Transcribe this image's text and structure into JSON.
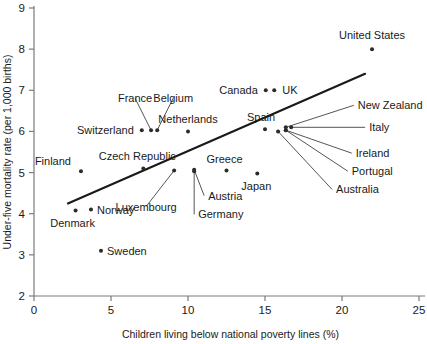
{
  "chart_data": {
    "type": "scatter",
    "title": "",
    "xlabel": "Children living below national poverty lines (%)",
    "ylabel": "Under-five mortality rate (per 1,000 births)",
    "xlim": [
      0,
      25
    ],
    "ylim": [
      2,
      9
    ],
    "xticks": [
      0,
      5,
      10,
      15,
      20,
      25
    ],
    "yticks": [
      2,
      3,
      4,
      5,
      6,
      7,
      8,
      9
    ],
    "xtick_labels": [
      "0",
      "5",
      "10",
      "15",
      "20",
      "25"
    ],
    "ytick_labels": [
      "2",
      "3",
      "4",
      "5",
      "6",
      "7",
      "8",
      "9"
    ],
    "grid": false,
    "legend": false,
    "points": [
      {
        "label": "Sweden",
        "x": 4.35,
        "y": 3.1,
        "label_dx": 6,
        "label_dy": 4,
        "anchor": "start",
        "leader": false
      },
      {
        "label": "Denmark",
        "x": 2.7,
        "y": 4.08,
        "label_dx": -3,
        "label_dy": 17,
        "anchor": "middle",
        "leader": false
      },
      {
        "label": "Norway",
        "x": 3.7,
        "y": 4.1,
        "label_dx": 6,
        "label_dy": 4,
        "anchor": "start",
        "leader": false
      },
      {
        "label": "Finland",
        "x": 3.05,
        "y": 5.03,
        "label_dx": -10,
        "label_dy": -6,
        "anchor": "end",
        "leader": false
      },
      {
        "label": "Czech Republic",
        "x": 7.1,
        "y": 5.1,
        "label_dx": -6,
        "label_dy": -8,
        "anchor": "middle",
        "leader": false
      },
      {
        "label": "Luxembourg",
        "x": 9.1,
        "y": 5.05,
        "label_dx": -28,
        "label_dy": 40,
        "anchor": "middle",
        "leader": true
      },
      {
        "label": "Austria",
        "x": 10.4,
        "y": 5.07,
        "label_dx": 14,
        "label_dy": 30,
        "anchor": "start",
        "leader": true
      },
      {
        "label": "Germany",
        "x": 10.4,
        "y": 5.03,
        "label_dx": 4,
        "label_dy": 47,
        "anchor": "start",
        "leader": true
      },
      {
        "label": "Greece",
        "x": 12.5,
        "y": 5.05,
        "label_dx": -2,
        "label_dy": -8,
        "anchor": "middle",
        "leader": false
      },
      {
        "label": "Japan",
        "x": 14.5,
        "y": 4.98,
        "label_dx": -1,
        "label_dy": 17,
        "anchor": "middle",
        "leader": false
      },
      {
        "label": "Switzerland",
        "x": 7.0,
        "y": 6.03,
        "label_dx": -8,
        "label_dy": 4,
        "anchor": "end",
        "leader": false
      },
      {
        "label": "France",
        "x": 7.6,
        "y": 6.03,
        "label_dx": -16,
        "label_dy": -28,
        "anchor": "middle",
        "leader": true
      },
      {
        "label": "Belgium",
        "x": 8.0,
        "y": 6.03,
        "label_dx": 16,
        "label_dy": -28,
        "anchor": "middle",
        "leader": true
      },
      {
        "label": "Netherlands",
        "x": 10.0,
        "y": 6.0,
        "label_dx": 0,
        "label_dy": -8,
        "anchor": "middle",
        "leader": false
      },
      {
        "label": "Spain",
        "x": 15.0,
        "y": 6.05,
        "label_dx": -4,
        "label_dy": -8,
        "anchor": "middle",
        "leader": false
      },
      {
        "label": "Australia",
        "x": 15.85,
        "y": 6.0,
        "label_dx": 58,
        "label_dy": 62,
        "anchor": "start",
        "leader": true
      },
      {
        "label": "Portugal",
        "x": 16.35,
        "y": 6.03,
        "label_dx": 66,
        "label_dy": 45,
        "anchor": "start",
        "leader": true
      },
      {
        "label": "Ireland",
        "x": 16.35,
        "y": 6.03,
        "label_dx": 70,
        "label_dy": 27,
        "anchor": "start",
        "leader": true
      },
      {
        "label": "Italy",
        "x": 16.7,
        "y": 6.1,
        "label_dx": 78,
        "label_dy": 4,
        "anchor": "start",
        "leader": true
      },
      {
        "label": "New Zealand",
        "x": 16.35,
        "y": 6.1,
        "label_dx": 72,
        "label_dy": -18,
        "anchor": "start",
        "leader": true
      },
      {
        "label": "Canada",
        "x": 15.05,
        "y": 7.0,
        "label_dx": -8,
        "label_dy": 4,
        "anchor": "end",
        "leader": false
      },
      {
        "label": "UK",
        "x": 15.6,
        "y": 7.0,
        "label_dx": 8,
        "label_dy": 4,
        "anchor": "start",
        "leader": false
      },
      {
        "label": "United States",
        "x": 21.95,
        "y": 8.0,
        "label_dx": 0,
        "label_dy": -10,
        "anchor": "middle",
        "leader": false
      }
    ],
    "trend_line": {
      "x0": 2.2,
      "y0": 4.25,
      "x1": 21.5,
      "y1": 7.4
    }
  }
}
